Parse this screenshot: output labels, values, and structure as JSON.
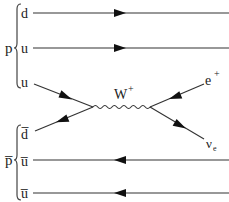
{
  "diagram": {
    "title": "",
    "type": "feynman",
    "proton": {
      "label": "p",
      "quarks": [
        {
          "label": "d",
          "role": "spectator"
        },
        {
          "label": "u",
          "role": "spectator"
        },
        {
          "label": "u",
          "role": "incoming"
        }
      ]
    },
    "antiproton": {
      "label": "p̅",
      "quarks": [
        {
          "label": "d̅",
          "role": "incoming"
        },
        {
          "label": "u̅",
          "role": "spectator"
        },
        {
          "label": "u̅",
          "role": "spectator"
        }
      ]
    },
    "boson": {
      "label": "W",
      "charge": "+"
    },
    "products": [
      {
        "label": "e",
        "superscript": "+"
      },
      {
        "label": "ν",
        "subscript": "e"
      }
    ]
  }
}
